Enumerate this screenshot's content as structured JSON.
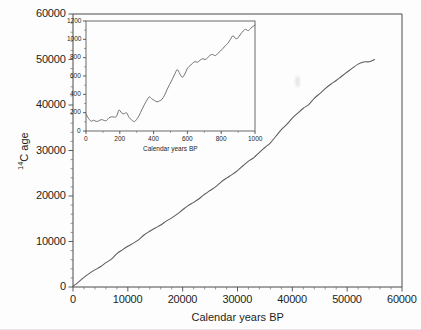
{
  "figure": {
    "background_color": "#fdfdfd",
    "curve_color": "#5a5a62",
    "axis_color": "#4a4a4a"
  },
  "chart_data": [
    {
      "type": "line",
      "id": "main-calibration-curve",
      "title": "",
      "xlabel": "Calendar years BP",
      "ylabel": "14C age",
      "ylabel_display": "¹⁴C age",
      "xlim": [
        0,
        60000
      ],
      "ylim": [
        0,
        60000
      ],
      "xticks": [
        0,
        10000,
        20000,
        30000,
        40000,
        50000,
        60000
      ],
      "yticks": [
        0,
        10000,
        20000,
        30000,
        40000,
        50000,
        60000
      ],
      "xticklabels": [
        "0",
        "10000",
        "20000",
        "30000",
        "40000",
        "50000",
        "60000"
      ],
      "yticklabels": [
        "0",
        "10000",
        "20000",
        "30000",
        "40000",
        "50000",
        "60000"
      ],
      "minor_ticks_per_interval": 5,
      "grid": false,
      "legend": false,
      "series": [
        {
          "name": "Radiocarbon calibration curve",
          "x": [
            0,
            1000,
            2000,
            3000,
            4000,
            5000,
            6000,
            7000,
            8000,
            9000,
            10000,
            11000,
            12000,
            13000,
            14000,
            15000,
            16000,
            17000,
            18000,
            19000,
            20000,
            21000,
            22000,
            23000,
            24000,
            25000,
            26000,
            27000,
            28000,
            29000,
            30000,
            31000,
            32000,
            33000,
            34000,
            35000,
            36000,
            37000,
            38000,
            39000,
            40000,
            41000,
            42000,
            43000,
            44000,
            45000,
            46000,
            47000,
            48000,
            49000,
            50000,
            51000,
            52000,
            53000,
            54000,
            55000
          ],
          "y": [
            150,
            1100,
            2050,
            2950,
            3750,
            4450,
            5250,
            6200,
            7350,
            8150,
            8900,
            9700,
            10450,
            11400,
            12250,
            12900,
            13650,
            14400,
            15200,
            16000,
            16900,
            17800,
            18700,
            19500,
            20300,
            21200,
            22100,
            23000,
            23900,
            24700,
            25600,
            26600,
            27600,
            28550,
            29600,
            30600,
            31700,
            33100,
            34500,
            35800,
            37100,
            38200,
            39200,
            40200,
            41400,
            42600,
            43600,
            44500,
            45400,
            46300,
            47300,
            48200,
            48900,
            49400,
            49500,
            50000
          ]
        }
      ]
    },
    {
      "type": "line",
      "id": "inset-recent-millennium",
      "title": "",
      "xlabel": "Calendar years BP",
      "ylabel": "",
      "xlim": [
        0,
        1000
      ],
      "ylim": [
        0,
        1200
      ],
      "xticks": [
        0,
        200,
        400,
        600,
        800,
        1000
      ],
      "yticks": [
        0,
        200,
        400,
        600,
        800,
        1000,
        1200
      ],
      "xticklabels": [
        "0",
        "200",
        "400",
        "600",
        "800",
        "1000"
      ],
      "yticklabels": [
        "0",
        "200",
        "400",
        "600",
        "800",
        "1000",
        "1200"
      ],
      "minor_ticks_per_interval": 2,
      "grid": false,
      "legend": false,
      "series": [
        {
          "name": "Radiocarbon calibration curve (0-1000 cal BP)",
          "x": [
            0,
            15,
            30,
            45,
            60,
            75,
            90,
            105,
            120,
            135,
            150,
            165,
            180,
            195,
            210,
            225,
            240,
            255,
            270,
            285,
            300,
            315,
            330,
            345,
            360,
            375,
            390,
            405,
            420,
            435,
            450,
            465,
            480,
            495,
            510,
            525,
            540,
            555,
            570,
            585,
            600,
            615,
            630,
            645,
            660,
            675,
            690,
            705,
            720,
            735,
            750,
            765,
            780,
            795,
            810,
            825,
            840,
            855,
            870,
            885,
            900,
            915,
            930,
            945,
            960,
            975,
            990,
            1000
          ],
          "y": [
            185,
            140,
            110,
            118,
            105,
            110,
            125,
            118,
            112,
            140,
            155,
            150,
            160,
            230,
            200,
            185,
            200,
            150,
            120,
            105,
            130,
            175,
            230,
            285,
            335,
            375,
            350,
            330,
            320,
            330,
            345,
            390,
            455,
            510,
            560,
            620,
            670,
            625,
            590,
            620,
            680,
            710,
            735,
            760,
            750,
            775,
            790,
            780,
            800,
            830,
            835,
            820,
            845,
            870,
            900,
            930,
            960,
            1000,
            1040,
            1010,
            1020,
            1060,
            1090,
            1110,
            1095,
            1120,
            1140,
            1155
          ]
        }
      ]
    }
  ],
  "main_axis": {
    "xlabel": "Calendar years BP",
    "ylabel_prefix": "14",
    "ylabel_suffix": "C age",
    "xticklabels": [
      "0",
      "10000",
      "20000",
      "30000",
      "40000",
      "50000",
      "60000"
    ],
    "yticklabels": [
      "0",
      "10000",
      "20000",
      "30000",
      "40000",
      "50000",
      "60000"
    ]
  },
  "inset_axis": {
    "xlabel": "Calendar years BP",
    "xticklabels": [
      "0",
      "200",
      "400",
      "600",
      "800",
      "1000"
    ],
    "yticklabels": [
      "0",
      "200",
      "400",
      "600",
      "800",
      "1000",
      "1200"
    ]
  }
}
